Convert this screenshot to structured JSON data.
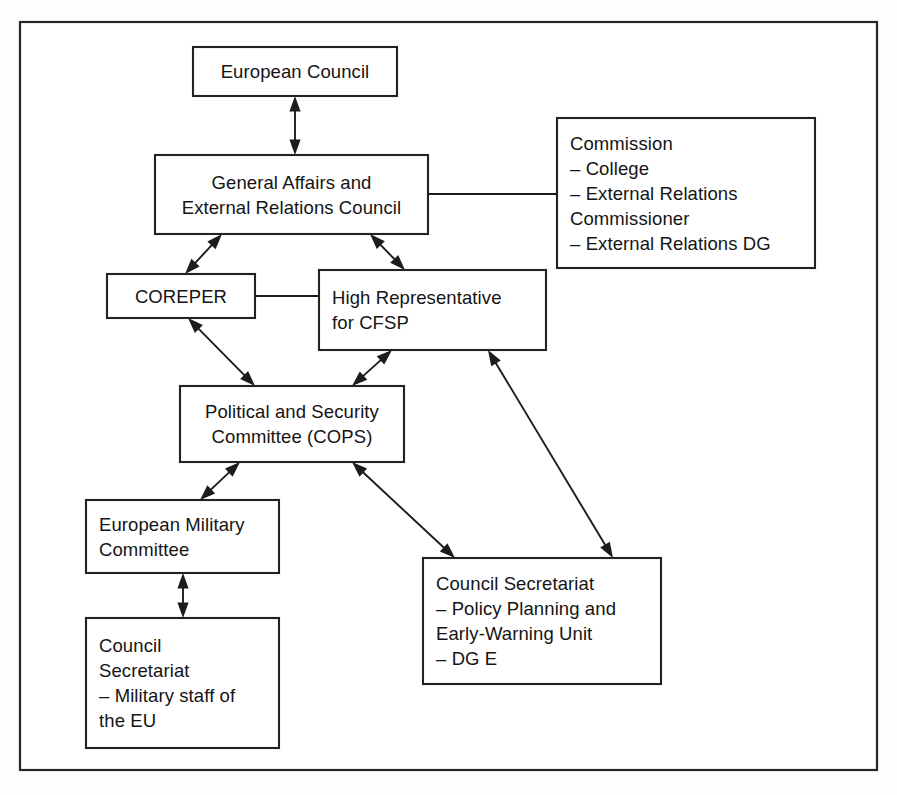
{
  "diagram": {
    "background_color": "#fdfdfc",
    "line_color": "#1c1c1c",
    "box_fill": "#ffffff",
    "nodes": [
      {
        "id": "european-council",
        "name": "european-council-box",
        "align": "center",
        "x": 193,
        "y": 47,
        "w": 204,
        "h": 49,
        "lines": [
          "European Council"
        ]
      },
      {
        "id": "gaerc",
        "name": "general-affairs-external-relations-council-box",
        "align": "center",
        "x": 155,
        "y": 155,
        "w": 273,
        "h": 79,
        "lines": [
          "General Affairs and",
          "External Relations Council"
        ]
      },
      {
        "id": "commission",
        "name": "commission-box",
        "align": "left",
        "x": 557,
        "y": 118,
        "w": 258,
        "h": 150,
        "lines": [
          "Commission",
          "– College",
          "– External Relations",
          "   Commissioner",
          "– External Relations DG"
        ]
      },
      {
        "id": "coreper",
        "name": "coreper-box",
        "align": "center",
        "x": 107,
        "y": 274,
        "w": 148,
        "h": 44,
        "lines": [
          "COREPER"
        ]
      },
      {
        "id": "high-representative",
        "name": "high-representative-cfsp-box",
        "align": "left",
        "x": 319,
        "y": 270,
        "w": 227,
        "h": 80,
        "lines": [
          "High Representative",
          "for CFSP"
        ]
      },
      {
        "id": "cops",
        "name": "political-security-committee-box",
        "align": "center",
        "x": 180,
        "y": 386,
        "w": 224,
        "h": 76,
        "lines": [
          "Political and Security",
          "Committee (COPS)"
        ]
      },
      {
        "id": "european-military-committee",
        "name": "european-military-committee-box",
        "align": "left",
        "x": 86,
        "y": 500,
        "w": 193,
        "h": 73,
        "lines": [
          "European Military",
          "Committee"
        ]
      },
      {
        "id": "council-secretariat-military",
        "name": "council-secretariat-military-staff-box",
        "align": "left",
        "x": 86,
        "y": 618,
        "w": 193,
        "h": 130,
        "lines": [
          "Council",
          "Secretariat",
          "– Military staff of",
          "   the EU"
        ]
      },
      {
        "id": "council-secretariat-policy",
        "name": "council-secretariat-policy-planning-box",
        "align": "left",
        "x": 423,
        "y": 558,
        "w": 238,
        "h": 126,
        "lines": [
          "Council Secretariat",
          "– Policy Planning and",
          "   Early-Warning Unit",
          "– DG E"
        ]
      }
    ],
    "connectors": [
      {
        "id": "ec-gaerc",
        "name": "connector-european-council-to-gaerc",
        "from": "european-council",
        "to": "gaerc",
        "arrow": "both",
        "x1": 295,
        "y1": 96,
        "x2": 295,
        "y2": 155
      },
      {
        "id": "gaerc-commission",
        "name": "connector-gaerc-to-commission",
        "from": "gaerc",
        "to": "commission",
        "arrow": "none",
        "x1": 428,
        "y1": 194,
        "x2": 557,
        "y2": 194
      },
      {
        "id": "gaerc-coreper",
        "name": "connector-gaerc-to-coreper",
        "from": "gaerc",
        "to": "coreper",
        "arrow": "both",
        "x1": 222,
        "y1": 234,
        "x2": 185,
        "y2": 274
      },
      {
        "id": "gaerc-highrep",
        "name": "connector-gaerc-to-high-representative",
        "from": "gaerc",
        "to": "high-representative",
        "arrow": "both",
        "x1": 370,
        "y1": 234,
        "x2": 405,
        "y2": 270
      },
      {
        "id": "coreper-highrep",
        "name": "connector-coreper-to-high-representative",
        "from": "coreper",
        "to": "high-representative",
        "arrow": "none",
        "x1": 255,
        "y1": 296,
        "x2": 319,
        "y2": 296
      },
      {
        "id": "coreper-cops",
        "name": "connector-coreper-to-cops",
        "from": "coreper",
        "to": "cops",
        "arrow": "both",
        "x1": 188,
        "y1": 318,
        "x2": 255,
        "y2": 386
      },
      {
        "id": "highrep-cops",
        "name": "connector-high-representative-to-cops",
        "from": "high-representative",
        "to": "cops",
        "arrow": "both",
        "x1": 392,
        "y1": 350,
        "x2": 352,
        "y2": 386
      },
      {
        "id": "cops-emc",
        "name": "connector-cops-to-european-military-committee",
        "from": "cops",
        "to": "european-military-committee",
        "arrow": "both",
        "x1": 240,
        "y1": 462,
        "x2": 200,
        "y2": 500
      },
      {
        "id": "cops-secretariat-policy",
        "name": "connector-cops-to-council-secretariat-policy",
        "from": "cops",
        "to": "council-secretariat-policy",
        "arrow": "both",
        "x1": 352,
        "y1": 462,
        "x2": 455,
        "y2": 558
      },
      {
        "id": "highrep-secretariat-policy",
        "name": "connector-high-representative-to-council-secretariat-policy",
        "from": "high-representative",
        "to": "council-secretariat-policy",
        "arrow": "both",
        "x1": 488,
        "y1": 350,
        "x2": 613,
        "y2": 558
      },
      {
        "id": "emc-secretariat-military",
        "name": "connector-european-military-committee-to-council-secretariat-military",
        "from": "european-military-committee",
        "to": "council-secretariat-military",
        "arrow": "both",
        "x1": 183,
        "y1": 573,
        "x2": 183,
        "y2": 618
      }
    ],
    "frame": {
      "name": "outer-frame",
      "x": 20,
      "y": 22,
      "w": 857,
      "h": 748
    }
  }
}
